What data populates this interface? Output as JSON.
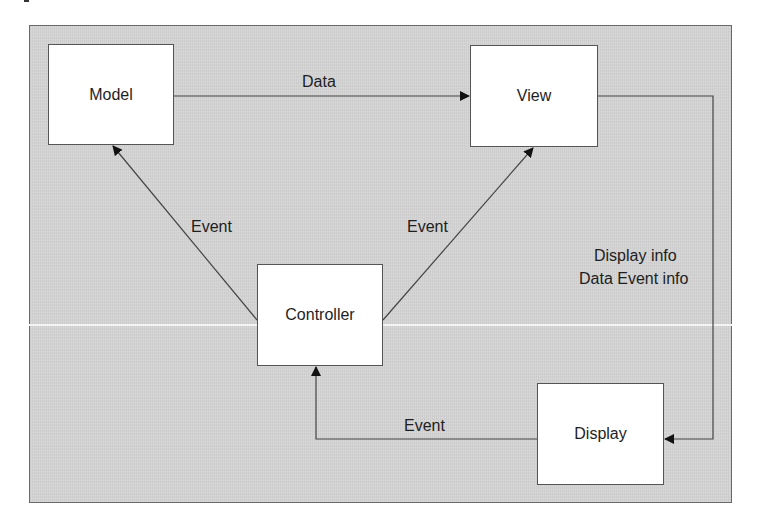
{
  "diagram": {
    "type": "flowchart",
    "background_color": "#d4d4d4",
    "border_color": "#555555",
    "nodes": [
      {
        "id": "model",
        "label": "Model"
      },
      {
        "id": "view",
        "label": "View"
      },
      {
        "id": "controller",
        "label": "Controller"
      },
      {
        "id": "display",
        "label": "Display"
      }
    ],
    "edges": [
      {
        "from": "model",
        "to": "view",
        "label": "Data"
      },
      {
        "from": "controller",
        "to": "model",
        "label": "Event"
      },
      {
        "from": "controller",
        "to": "view",
        "label": "Event"
      },
      {
        "from": "view",
        "to": "display",
        "label": "Display info\nData Event info"
      },
      {
        "from": "display",
        "to": "controller",
        "label": "Event"
      }
    ]
  },
  "labels": {
    "model": "Model",
    "view": "View",
    "controller": "Controller",
    "display": "Display",
    "data_edge": "Data",
    "event_left": "Event",
    "event_right": "Event",
    "display_info_line1": "Display info",
    "display_info_line2": "Data Event info",
    "event_bottom": "Event"
  }
}
